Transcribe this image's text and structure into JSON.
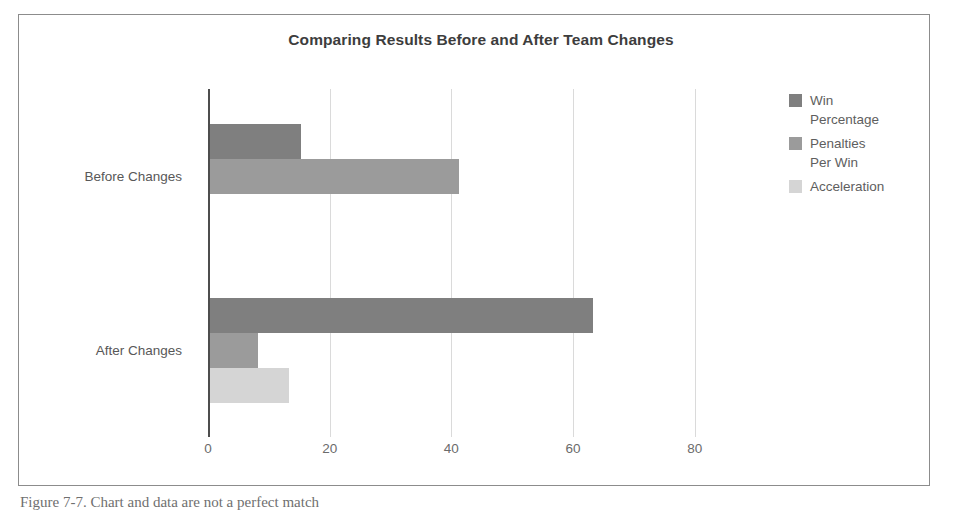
{
  "figure": {
    "caption": "Figure 7-7. Chart and data are not a perfect match"
  },
  "chart_data": {
    "type": "bar",
    "orientation": "horizontal",
    "title": "Comparing Results Before and After Team Changes",
    "xlabel": "",
    "ylabel": "",
    "categories": [
      "Before Changes",
      "After Changes"
    ],
    "series": [
      {
        "name": "Win Percentage",
        "color": "#7f7f7f",
        "values": [
          15,
          63
        ]
      },
      {
        "name": "Penalties Per Win",
        "color": "#9b9b9b",
        "values": [
          41,
          8
        ]
      },
      {
        "name": "Acceleration",
        "color": "#d5d5d5",
        "values": [
          0,
          13
        ]
      }
    ],
    "legend_labels": [
      "Win\nPercentage",
      "Penalties\nPer Win",
      "Acceleration"
    ],
    "legend_position": "right",
    "xlim": [
      0,
      95
    ],
    "xticks": [
      0,
      20,
      40,
      60,
      80
    ],
    "xtick_labels": [
      "0",
      "20",
      "40",
      "60",
      "80"
    ],
    "grid": true,
    "grid_axis": "x"
  }
}
